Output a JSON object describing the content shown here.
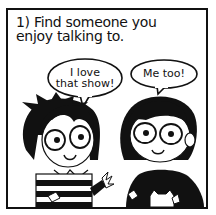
{
  "panel": {
    "caption": "1) Find someone you enjoy talking to.",
    "bubbles": [
      {
        "speaker": "left-character",
        "line1": "I love",
        "line2": "that show!"
      },
      {
        "speaker": "right-character",
        "line1": "Me too!"
      }
    ],
    "colors": {
      "ink": "#111111",
      "paper": "#ffffff"
    }
  }
}
